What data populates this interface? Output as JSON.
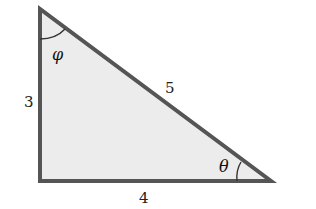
{
  "diagram": {
    "type": "right-triangle",
    "colors": {
      "fill": "#ececec",
      "stroke": "#555555",
      "arc": "#333333",
      "text": "#222222"
    },
    "sides": {
      "vertical": "3",
      "horizontal": "4",
      "hypotenuse": "5"
    },
    "angles": {
      "top": "φ",
      "bottom_right": "θ"
    }
  }
}
